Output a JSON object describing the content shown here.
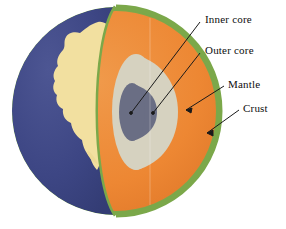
{
  "diagram": {
    "background_color": "#ffffff",
    "sphere": {
      "center_x": 116,
      "center_y": 111,
      "radius": 104
    },
    "layers": [
      {
        "id": "crust",
        "label": "Crust",
        "color": "#7ba84a",
        "order": 1
      },
      {
        "id": "mantle",
        "label": "Mantle",
        "color": "#ed8733",
        "order": 2
      },
      {
        "id": "outer_core",
        "label": "Outer core",
        "color": "#d6d2c0",
        "order": 3
      },
      {
        "id": "inner_core",
        "label": "Inner core",
        "color": "#6a6e84",
        "order": 4
      }
    ],
    "surface": {
      "ocean_label": "ocean",
      "ocean_color": "#3d4684",
      "land_label": "land",
      "land_color": "#f2e0a0"
    },
    "labels": [
      {
        "id": "inner-core",
        "text": "Inner core"
      },
      {
        "id": "outer-core",
        "text": "Outer core"
      },
      {
        "id": "mantle",
        "text": "Mantle"
      },
      {
        "id": "crust",
        "text": "Crust"
      }
    ],
    "leader_line_color": "#1a1a1a"
  }
}
